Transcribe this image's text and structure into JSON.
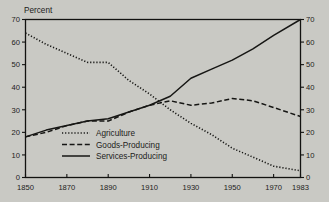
{
  "figure": {
    "background_color": "#c9c9c4",
    "ink_color": "#161614",
    "y_axis_title": "Percent"
  },
  "axis": {
    "y_ticks": [
      "0",
      "10",
      "20",
      "30",
      "40",
      "50",
      "60",
      "70"
    ],
    "x_ticks": [
      "1850",
      "1870",
      "1890",
      "1910",
      "1930",
      "1950",
      "1970",
      "1983"
    ]
  },
  "legend": {
    "items": [
      {
        "label": "Agriculture",
        "style": "dotted"
      },
      {
        "label": "Goods-Producing",
        "style": "dashed"
      },
      {
        "label": "Services-Producing",
        "style": "solid"
      }
    ]
  },
  "chart_data": {
    "type": "line",
    "title": "",
    "subtitle": "",
    "xlabel": "",
    "ylabel": "Percent",
    "xlim": [
      1850,
      1983
    ],
    "ylim": [
      0,
      70
    ],
    "grid": false,
    "legend_position": "inside-lower-center",
    "y_ticks": [
      0,
      10,
      20,
      30,
      40,
      50,
      60,
      70
    ],
    "x_ticks": [
      1850,
      1870,
      1890,
      1910,
      1930,
      1950,
      1970,
      1983
    ],
    "annotations": [
      "Right-hand axis duplicates left-hand axis scale (0-70 Percent)"
    ],
    "series": [
      {
        "name": "Agriculture",
        "style": "dotted",
        "x": [
          1850,
          1860,
          1870,
          1880,
          1890,
          1900,
          1910,
          1920,
          1930,
          1940,
          1950,
          1960,
          1970,
          1983
        ],
        "values": [
          64,
          59,
          55,
          51,
          51,
          43,
          37,
          30,
          24,
          19,
          13,
          9,
          5,
          3
        ]
      },
      {
        "name": "Goods-Producing",
        "style": "dashed",
        "x": [
          1850,
          1860,
          1870,
          1880,
          1890,
          1900,
          1910,
          1920,
          1930,
          1940,
          1950,
          1960,
          1970,
          1983
        ],
        "values": [
          18,
          20,
          23,
          25,
          25,
          29,
          32,
          34,
          32,
          33,
          35,
          34,
          31,
          27
        ]
      },
      {
        "name": "Services-Producing",
        "style": "solid",
        "x": [
          1850,
          1860,
          1870,
          1880,
          1890,
          1900,
          1910,
          1920,
          1930,
          1940,
          1950,
          1960,
          1970,
          1983
        ],
        "values": [
          18,
          21,
          23,
          25,
          26,
          29,
          32,
          36,
          44,
          48,
          52,
          57,
          63,
          70
        ]
      }
    ]
  }
}
